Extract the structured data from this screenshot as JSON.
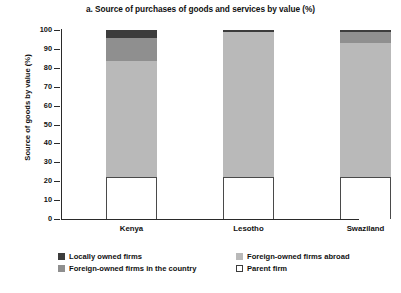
{
  "chart_data": {
    "type": "bar",
    "subtype": "stacked-percentage-column",
    "title": "a. Source of purchases of goods and services by value (%)",
    "xlabel": "",
    "ylabel": "Source of goods by value (%)",
    "categories": [
      "Kenya",
      "Lesotho",
      "Swaziland"
    ],
    "ylim": [
      0,
      100
    ],
    "yticks": [
      0,
      10,
      20,
      30,
      40,
      50,
      60,
      70,
      80,
      90,
      100
    ],
    "ytick_labels": [
      "0",
      "10",
      "20",
      "30",
      "40",
      "50",
      "60",
      "70",
      "80",
      "90",
      "100"
    ],
    "grid": false,
    "legend_position": "bottom",
    "series": [
      {
        "name": "Parent firm",
        "color": "#ffffff",
        "border": "#4a4a4a",
        "values": [
          22,
          22,
          22
        ]
      },
      {
        "name": "Foreign-owned firms in the country",
        "color": "#b9b9b9",
        "values": [
          61.5,
          77,
          71
        ]
      },
      {
        "name": "Foreign-owned firms abroad",
        "color": "#8f8f8f",
        "values": [
          12.5,
          0,
          6
        ]
      },
      {
        "name": "Locally owned firms",
        "color": "#3c3c3c",
        "values": [
          4,
          1,
          1
        ]
      }
    ]
  },
  "legend": {
    "items": [
      {
        "label": "Locally owned firms",
        "color": "#3c3c3c"
      },
      {
        "label": "Foreign-owned firms abroad",
        "color": "#b9b9b9"
      },
      {
        "label": "Foreign-owned firms in the country",
        "color": "#8f8f8f"
      },
      {
        "label": "Parent firm",
        "color": "#ffffff"
      }
    ]
  }
}
